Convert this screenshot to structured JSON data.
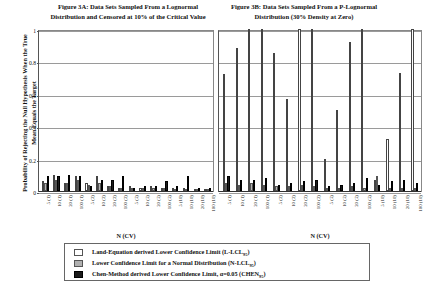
{
  "figureA": {
    "title": "Figure 3A: Data Sets Sampled From a Lognormal Distribution and Censored at 10% of the Critical Value",
    "xlabel": "N (CV)"
  },
  "figureB": {
    "title": "Figure 3B: Data Sets Sampled From a P-Lognormal Distribution (30% Density at Zero)",
    "xlabel": "N (CV)"
  },
  "ylabel": "Probability of Rejecting the Null Hypothesis When the True Mean Equals the Target",
  "legend": {
    "items": [
      {
        "swatch": "white",
        "label": "Land-Equation derived Lower Confidence Limit (L-LCL",
        "sub": "95",
        "tail": ")"
      },
      {
        "swatch": "gray",
        "label": "Lower Confidence Limit for a Normal Distribution (N-LCL",
        "sub": "95",
        "tail": ")"
      },
      {
        "swatch": "black",
        "label": "Chen-Method derived Lower Confidence Limit, α=0.05 (CHEN",
        "sub": "95",
        "tail": ")"
      }
    ]
  },
  "chart_data": [
    {
      "type": "bar",
      "title": "Figure 3A: Data Sets Sampled From a Lognormal Distribution and Censored at 10% of the Critical Value",
      "xlabel": "N (CV)",
      "ylabel": "Probability of Rejecting the Null Hypothesis When the True Mean Equals the Target",
      "ylim": [
        0,
        1
      ],
      "yticks": [
        0,
        0.2,
        0.4,
        0.6,
        0.8,
        1
      ],
      "ytick_labels": [
        "0",
        "0.2",
        "0.4",
        "0.6",
        "0.8",
        "1"
      ],
      "grid": true,
      "legend_position": "bottom",
      "categories": [
        "5 (1)",
        "10 (1)",
        "20 (1)",
        "100 (1)",
        "5 (2)",
        "10 (2)",
        "20 (2)",
        "100 (2)",
        "5 (5)",
        "10 (5)",
        "20 (5)",
        "100 (5)",
        "5 (10)",
        "10 (10)",
        "20 (10)",
        "100 (10)"
      ],
      "series": [
        {
          "name": "L-LCL95",
          "color": "#ffffff",
          "values": [
            0.06,
            0.1,
            0.05,
            0.09,
            0.05,
            0.09,
            0.03,
            0.02,
            0.03,
            0.02,
            0.03,
            0.02,
            0.02,
            0.02,
            0.01,
            0.01
          ]
        },
        {
          "name": "N-LCL95",
          "color": "#b3b3b3",
          "values": [
            0.05,
            0.07,
            0.05,
            0.07,
            0.04,
            0.05,
            0.03,
            0.02,
            0.02,
            0.02,
            0.02,
            0.02,
            0.01,
            0.01,
            0.01,
            0.01
          ]
        },
        {
          "name": "CHEN95",
          "color": "#1a1a1a",
          "values": [
            0.09,
            0.09,
            0.1,
            0.09,
            0.03,
            0.07,
            0.07,
            0.09,
            0.02,
            0.03,
            0.03,
            0.06,
            0.03,
            0.09,
            0.02,
            0.02
          ]
        }
      ]
    },
    {
      "type": "bar",
      "title": "Figure 3B: Data Sets Sampled From a P-Lognormal Distribution (30% Density at Zero)",
      "xlabel": "N (CV)",
      "ylabel": "Probability of Rejecting the Null Hypothesis When the True Mean Equals the Target",
      "ylim": [
        0,
        1
      ],
      "yticks": [
        0,
        0.2,
        0.4,
        0.6,
        0.8,
        1
      ],
      "grid": true,
      "legend_position": "bottom",
      "categories": [
        "5 (1)",
        "10 (1)",
        "20 (1)",
        "100 (1)",
        "5 (2)",
        "10 (2)",
        "20 (2)",
        "100 (2)",
        "5 (5)",
        "10 (5)",
        "20 (5)",
        "100 (5)",
        "5 (10)",
        "10 (10)",
        "20 (10)",
        "100 (10)"
      ],
      "series": [
        {
          "name": "L-LCL95",
          "color": "#ffffff",
          "values": [
            0.72,
            0.88,
            1.0,
            1.0,
            0.85,
            0.57,
            1.0,
            1.0,
            0.2,
            0.5,
            0.92,
            1.0,
            0.07,
            0.32,
            0.73,
            1.0
          ]
        },
        {
          "name": "N-LCL95",
          "color": "#b3b3b3",
          "values": [
            0.05,
            0.04,
            0.05,
            0.04,
            0.03,
            0.03,
            0.04,
            0.03,
            0.02,
            0.02,
            0.03,
            0.02,
            0.09,
            0.02,
            0.02,
            0.02
          ]
        },
        {
          "name": "CHEN95",
          "color": "#1a1a1a",
          "values": [
            0.09,
            0.07,
            0.07,
            0.08,
            0.04,
            0.05,
            0.06,
            0.07,
            0.03,
            0.04,
            0.05,
            0.08,
            0.04,
            0.06,
            0.07,
            0.05
          ]
        }
      ]
    }
  ]
}
